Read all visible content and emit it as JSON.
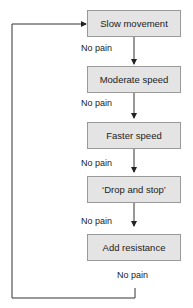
{
  "flowchart": {
    "steps": [
      {
        "label": "Slow movement"
      },
      {
        "label": "Moderate speed"
      },
      {
        "label": "Faster speed"
      },
      {
        "label": "‘Drop and stop’"
      },
      {
        "label": "Add resistance"
      }
    ],
    "transitions": [
      {
        "label": "No pain"
      },
      {
        "label": "No pain"
      },
      {
        "label": "No pain"
      },
      {
        "label": "No pain"
      },
      {
        "label": "No pain"
      }
    ]
  }
}
